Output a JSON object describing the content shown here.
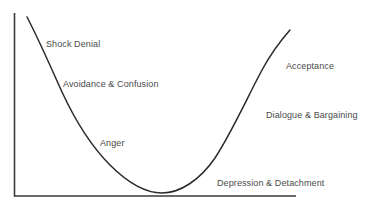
{
  "diagram": {
    "type": "curve",
    "colors": {
      "axis": "#3a3a3a",
      "curve": "#2a2a2a",
      "text": "#4a4a4a",
      "background": "#ffffff"
    },
    "stages": [
      {
        "id": "shock-denial",
        "label": "Shock Denial"
      },
      {
        "id": "avoidance-confusion",
        "label": "Avoidance & Confusion"
      },
      {
        "id": "anger",
        "label": "Anger"
      },
      {
        "id": "depression-detachment",
        "label": "Depression & Detachment"
      },
      {
        "id": "dialogue-bargaining",
        "label": "Dialogue & Bargaining"
      },
      {
        "id": "acceptance",
        "label": "Acceptance"
      }
    ]
  }
}
